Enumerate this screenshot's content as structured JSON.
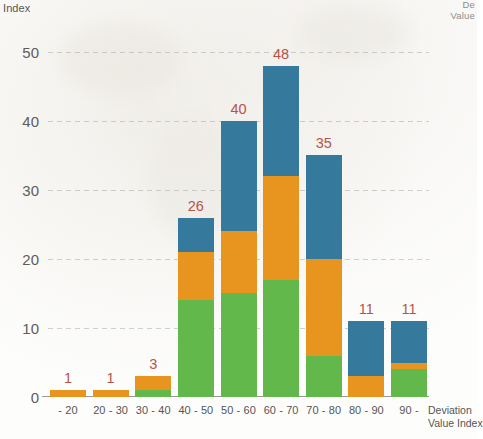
{
  "corner_note": "De\nValue",
  "axes": {
    "y_title": "Index",
    "x_title_line1": "Deviation",
    "x_title_line2": "Value Index",
    "y_ticks": [
      "0",
      "10",
      "20",
      "30",
      "40",
      "50"
    ]
  },
  "colors": {
    "green": "#62b84a",
    "orange": "#e8951f",
    "blue": "#357a9d",
    "label": "#b5544a",
    "gridline": "#aaaaaa",
    "axis_text": "#555555"
  },
  "chart_data": {
    "type": "bar",
    "title": "",
    "subtitle": "",
    "xlabel": "Deviation Value Index",
    "ylabel": "Index",
    "stacked": true,
    "grid": true,
    "legend": "none",
    "ylim": [
      0,
      52
    ],
    "yticks": [
      0,
      10,
      20,
      30,
      40,
      50
    ],
    "categories": [
      "- 20",
      "20 - 30",
      "30 - 40",
      "40 - 50",
      "50 - 60",
      "60 - 70",
      "70 - 80",
      "80 - 90",
      "90 -"
    ],
    "totals": [
      1,
      1,
      3,
      26,
      40,
      48,
      35,
      11,
      11
    ],
    "data_labels": [
      "1",
      "1",
      "3",
      "26",
      "40",
      "48",
      "35",
      "11",
      "11"
    ],
    "series": [
      {
        "name": "green",
        "color": "#62b84a",
        "values": [
          0,
          0,
          1,
          14,
          15,
          17,
          6,
          0,
          4
        ]
      },
      {
        "name": "orange",
        "color": "#e8951f",
        "values": [
          1,
          1,
          2,
          7,
          9,
          15,
          14,
          3,
          1
        ]
      },
      {
        "name": "blue",
        "color": "#357a9d",
        "values": [
          0,
          0,
          0,
          5,
          16,
          16,
          15,
          8,
          6
        ]
      }
    ]
  }
}
